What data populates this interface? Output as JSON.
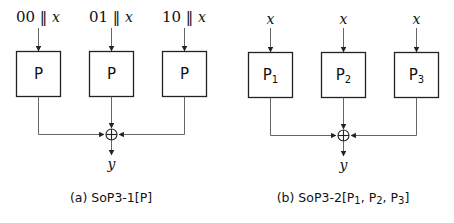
{
  "panel_a": {
    "inputs": [
      {
        "prefix": "00",
        "sep": " ‖ ",
        "var": "x"
      },
      {
        "prefix": "01",
        "sep": " ‖ ",
        "var": "x"
      },
      {
        "prefix": "10",
        "sep": " ‖ ",
        "var": "x"
      }
    ],
    "boxes": [
      {
        "label": "P",
        "sub": ""
      },
      {
        "label": "P",
        "sub": ""
      },
      {
        "label": "P",
        "sub": ""
      }
    ],
    "combiner": "xor",
    "output": "y",
    "caption_tag": "(a)",
    "caption_name": "SoP3-1[P]"
  },
  "panel_b": {
    "inputs": [
      {
        "var": "x"
      },
      {
        "var": "x"
      },
      {
        "var": "x"
      }
    ],
    "boxes": [
      {
        "label": "P",
        "sub": "1"
      },
      {
        "label": "P",
        "sub": "2"
      },
      {
        "label": "P",
        "sub": "3"
      }
    ],
    "combiner": "xor",
    "output": "y",
    "caption_tag": "(b)",
    "caption_name_prefix": "SoP3-2[P",
    "caption_subs": [
      "1",
      "2",
      "3"
    ]
  }
}
